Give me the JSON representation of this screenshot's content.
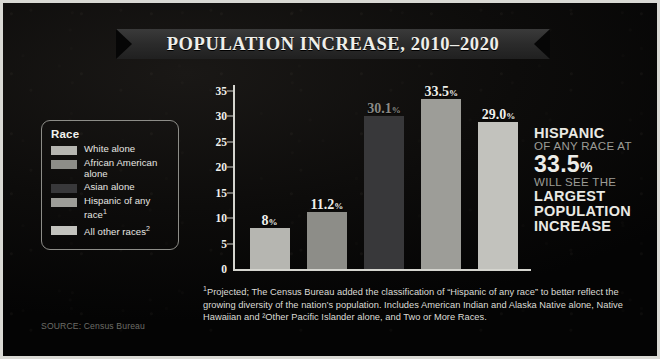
{
  "title": "POPULATION INCREASE, 2010–2020",
  "legend": {
    "heading": "Race",
    "items": [
      {
        "label": "White alone",
        "color": "#b6b6b1"
      },
      {
        "label": "African American alone",
        "color": "#8d8d88"
      },
      {
        "label": "Asian alone",
        "color": "#38383a"
      },
      {
        "label": "Hispanic of any race",
        "sup": "1",
        "color": "#9d9d98"
      },
      {
        "label": "All other races",
        "sup": "2",
        "color": "#c2c2bd"
      }
    ]
  },
  "chart_data": {
    "type": "bar",
    "title": "POPULATION INCREASE, 2010–2020",
    "xlabel": "",
    "ylabel": "",
    "ylim": [
      0,
      35
    ],
    "yticks": [
      0,
      5,
      10,
      15,
      20,
      25,
      30,
      35
    ],
    "grid": false,
    "legend_position": "left",
    "categories": [
      "White alone",
      "African American alone",
      "Asian alone",
      "Hispanic of any race",
      "All other races"
    ],
    "values": [
      8,
      11.2,
      30.1,
      33.5,
      29.0
    ],
    "value_labels": [
      "8%",
      "11.2%",
      "30.1%",
      "33.5%",
      "29.0%"
    ],
    "bar_colors": [
      "#b6b6b1",
      "#8d8d88",
      "#38383a",
      "#9d9d98",
      "#c2c2bd"
    ],
    "label_colors": [
      "#efefea",
      "#efefea",
      "#8a8a85",
      "#efefea",
      "#efefea"
    ]
  },
  "callout": {
    "line1": "HISPANIC",
    "line2": "OF ANY RACE AT",
    "line3_num": "33.5",
    "line3_pct": "%",
    "line4": "WILL SEE THE",
    "line5": "LARGEST",
    "line6": "POPULATION",
    "line7": "INCREASE"
  },
  "footnote": "Projected; The Census Bureau added the classification of “Hispanic of any race” to better reflect the growing diversity of the nation’s population. Includes American Indian and Alaska Native alone, Native Hawaiian and ²Other Pacific Islander alone, and Two or More Races.",
  "footnote_marker": "1",
  "source": "SOURCE: Census Bureau"
}
